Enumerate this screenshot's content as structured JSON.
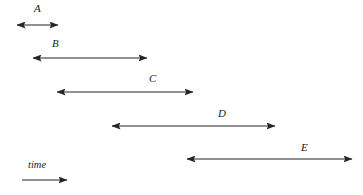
{
  "figure": {
    "type": "timeline-interval-diagram",
    "background_color": "#ffffff",
    "stroke_color": "#262626",
    "width": 363,
    "height": 195
  },
  "axis": {
    "label": "time",
    "label_x": 28,
    "label_y": 160,
    "arrow": {
      "name": "time-axis-arrow",
      "x1": 22,
      "x2": 67,
      "y": 180,
      "heads": "right"
    }
  },
  "intervals": [
    {
      "label": "A",
      "label_x": 34,
      "label_y": 3,
      "x1": 17,
      "x2": 58,
      "y": 25,
      "heads": "both"
    },
    {
      "label": "B",
      "label_x": 52,
      "label_y": 38,
      "x1": 33,
      "x2": 147,
      "y": 58,
      "heads": "both"
    },
    {
      "label": "C",
      "label_x": 149,
      "label_y": 73,
      "x1": 57,
      "x2": 193,
      "y": 92,
      "heads": "both"
    },
    {
      "label": "D",
      "label_x": 218,
      "label_y": 108,
      "x1": 112,
      "x2": 275,
      "y": 126,
      "heads": "both"
    },
    {
      "label": "E",
      "label_x": 301,
      "label_y": 142,
      "x1": 187,
      "x2": 352,
      "y": 159,
      "heads": "both"
    }
  ]
}
